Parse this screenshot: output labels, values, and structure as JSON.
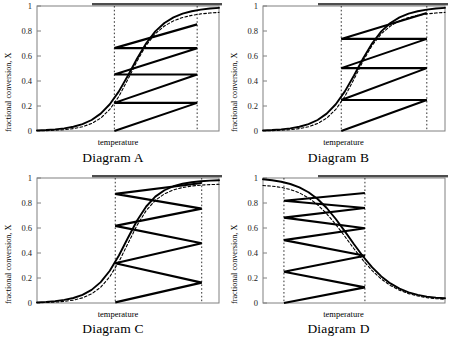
{
  "figure": {
    "panels": [
      {
        "id": "A",
        "caption": "Diagram A",
        "xlabel": "temperature",
        "ylabel": "fractional conversion, X"
      },
      {
        "id": "B",
        "caption": "Diagram B",
        "xlabel": "temperature",
        "ylabel": "fractional conversion, X"
      },
      {
        "id": "C",
        "caption": "Diagram C",
        "xlabel": "temperature",
        "ylabel": "fractional conversion, X"
      },
      {
        "id": "D",
        "caption": "Diagram D",
        "xlabel": "temperature",
        "ylabel": "fractional conversion, X"
      }
    ],
    "ytick_labels": [
      "1",
      "0.8",
      "0.6",
      "0.4",
      "0.2",
      "0"
    ],
    "colors": {
      "line": "#000000",
      "frame": "#808080",
      "dashed_guide": "#333333",
      "top_bar": "#4d4d4d"
    }
  },
  "chart_data": [
    {
      "type": "line",
      "id": "A",
      "title": "Diagram A",
      "xlabel": "temperature",
      "ylabel": "fractional conversion, X",
      "xlim": [
        0,
        1
      ],
      "ylim": [
        0,
        1
      ],
      "yticks": [
        0,
        0.2,
        0.4,
        0.6,
        0.8,
        1
      ],
      "grid": false,
      "series": [
        {
          "name": "equilibrium conversion (solid sigmoid)",
          "style": "solid",
          "x": [
            0.0,
            0.05,
            0.1,
            0.15,
            0.2,
            0.25,
            0.3,
            0.35,
            0.4,
            0.45,
            0.5,
            0.55,
            0.6,
            0.65,
            0.7,
            0.75,
            0.8,
            0.85,
            0.9,
            0.95,
            1.0
          ],
          "y": [
            0.005,
            0.008,
            0.013,
            0.021,
            0.034,
            0.055,
            0.088,
            0.139,
            0.214,
            0.317,
            0.444,
            0.58,
            0.702,
            0.797,
            0.864,
            0.909,
            0.939,
            0.958,
            0.971,
            0.98,
            0.985
          ]
        },
        {
          "name": "rate-maximum locus (dashed sigmoid)",
          "style": "dashed",
          "x": [
            0.0,
            0.05,
            0.1,
            0.15,
            0.2,
            0.25,
            0.3,
            0.35,
            0.4,
            0.45,
            0.5,
            0.55,
            0.6,
            0.65,
            0.7,
            0.75,
            0.8,
            0.85,
            0.9,
            0.95,
            1.0
          ],
          "y": [
            0.002,
            0.003,
            0.006,
            0.011,
            0.019,
            0.034,
            0.06,
            0.103,
            0.173,
            0.277,
            0.414,
            0.56,
            0.686,
            0.778,
            0.84,
            0.881,
            0.908,
            0.925,
            0.937,
            0.944,
            0.949
          ]
        }
      ],
      "operating_path": {
        "description": "Interstage-cooled staircase: adiabatic heat-up legs descending left-to-right, cooling legs horizontal back to the reactor-inlet line.",
        "points": [
          [
            0.425,
            0.0
          ],
          [
            0.88,
            0.225
          ],
          [
            0.425,
            0.225
          ],
          [
            0.88,
            0.452
          ],
          [
            0.425,
            0.452
          ],
          [
            0.88,
            0.663
          ],
          [
            0.425,
            0.663
          ],
          [
            0.88,
            0.853
          ]
        ],
        "guide_lines_x": [
          0.425,
          0.88
        ]
      }
    },
    {
      "type": "line",
      "id": "B",
      "title": "Diagram B",
      "xlabel": "temperature",
      "ylabel": "fractional conversion, X",
      "xlim": [
        0,
        1
      ],
      "ylim": [
        0,
        1
      ],
      "yticks": [
        0,
        0.2,
        0.4,
        0.6,
        0.8,
        1
      ],
      "grid": false,
      "series": [
        {
          "name": "equilibrium conversion (solid sigmoid)",
          "style": "solid",
          "x": [
            0.0,
            0.05,
            0.1,
            0.15,
            0.2,
            0.25,
            0.3,
            0.35,
            0.4,
            0.45,
            0.5,
            0.55,
            0.6,
            0.65,
            0.7,
            0.75,
            0.8,
            0.85,
            0.9,
            0.95,
            1.0
          ],
          "y": [
            0.005,
            0.008,
            0.013,
            0.021,
            0.034,
            0.055,
            0.088,
            0.139,
            0.214,
            0.317,
            0.444,
            0.58,
            0.702,
            0.797,
            0.864,
            0.909,
            0.939,
            0.958,
            0.971,
            0.98,
            0.985
          ]
        },
        {
          "name": "rate-maximum locus (dashed sigmoid)",
          "style": "dashed",
          "x": [
            0.0,
            0.05,
            0.1,
            0.15,
            0.2,
            0.25,
            0.3,
            0.35,
            0.4,
            0.45,
            0.5,
            0.55,
            0.6,
            0.65,
            0.7,
            0.75,
            0.8,
            0.85,
            0.9,
            0.95,
            1.0
          ],
          "y": [
            0.002,
            0.003,
            0.006,
            0.011,
            0.019,
            0.034,
            0.06,
            0.103,
            0.173,
            0.277,
            0.414,
            0.56,
            0.686,
            0.778,
            0.84,
            0.881,
            0.908,
            0.925,
            0.937,
            0.944,
            0.949
          ]
        }
      ],
      "operating_path": {
        "description": "Staircase with ascending adiabatic legs left-to-right and horizontal cooling legs returning leftwards.",
        "points": [
          [
            0.43,
            0.0
          ],
          [
            0.9,
            0.248
          ],
          [
            0.43,
            0.248
          ],
          [
            0.9,
            0.503
          ],
          [
            0.43,
            0.503
          ],
          [
            0.9,
            0.737
          ],
          [
            0.43,
            0.737
          ],
          [
            0.9,
            0.945
          ]
        ],
        "guide_lines_x": [
          0.43,
          0.9
        ]
      }
    },
    {
      "type": "line",
      "id": "C",
      "title": "Diagram C",
      "xlabel": "temperature",
      "ylabel": "fractional conversion, X",
      "xlim": [
        0,
        1
      ],
      "ylim": [
        0,
        1
      ],
      "yticks": [
        0,
        0.2,
        0.4,
        0.6,
        0.8,
        1
      ],
      "grid": false,
      "series": [
        {
          "name": "equilibrium conversion (solid sigmoid)",
          "style": "solid",
          "x": [
            0.0,
            0.05,
            0.1,
            0.15,
            0.2,
            0.25,
            0.3,
            0.35,
            0.4,
            0.45,
            0.5,
            0.55,
            0.6,
            0.65,
            0.7,
            0.75,
            0.8,
            0.85,
            0.9,
            0.95,
            1.0
          ],
          "y": [
            0.005,
            0.009,
            0.015,
            0.025,
            0.04,
            0.065,
            0.105,
            0.167,
            0.258,
            0.38,
            0.522,
            0.66,
            0.772,
            0.851,
            0.902,
            0.934,
            0.954,
            0.966,
            0.974,
            0.979,
            0.982
          ]
        },
        {
          "name": "rate-maximum locus (dashed sigmoid)",
          "style": "dashed",
          "x": [
            0.0,
            0.05,
            0.1,
            0.15,
            0.2,
            0.25,
            0.3,
            0.35,
            0.4,
            0.45,
            0.5,
            0.55,
            0.6,
            0.65,
            0.7,
            0.75,
            0.8,
            0.85,
            0.9,
            0.95,
            1.0
          ],
          "y": [
            0.002,
            0.004,
            0.007,
            0.013,
            0.023,
            0.041,
            0.073,
            0.126,
            0.21,
            0.33,
            0.477,
            0.622,
            0.74,
            0.821,
            0.873,
            0.905,
            0.924,
            0.936,
            0.943,
            0.947,
            0.95
          ]
        }
      ],
      "operating_path": {
        "description": "Sawtooth: ascending adiabatic legs to the right guide line, then ascending return legs back to the equilibrium curve.",
        "points": [
          [
            0.43,
            0.005
          ],
          [
            0.905,
            0.163
          ],
          [
            0.43,
            0.318
          ],
          [
            0.905,
            0.478
          ],
          [
            0.43,
            0.617
          ],
          [
            0.905,
            0.755
          ],
          [
            0.43,
            0.873
          ],
          [
            0.905,
            0.96
          ]
        ],
        "guide_lines_x": [
          0.43,
          0.905
        ]
      }
    },
    {
      "type": "line",
      "id": "D",
      "title": "Diagram D",
      "xlabel": "temperature",
      "ylabel": "fractional conversion, X",
      "xlim": [
        0,
        1
      ],
      "ylim": [
        0,
        1
      ],
      "yticks": [
        0,
        0.2,
        0.4,
        0.6,
        0.8,
        1
      ],
      "grid": false,
      "series": [
        {
          "name": "equilibrium conversion (solid decreasing sigmoid)",
          "style": "solid",
          "x": [
            0.0,
            0.05,
            0.1,
            0.15,
            0.2,
            0.25,
            0.3,
            0.35,
            0.4,
            0.45,
            0.5,
            0.55,
            0.6,
            0.65,
            0.7,
            0.75,
            0.8,
            0.85,
            0.9,
            0.95,
            1.0
          ],
          "y": [
            0.99,
            0.982,
            0.97,
            0.952,
            0.925,
            0.886,
            0.832,
            0.76,
            0.672,
            0.573,
            0.47,
            0.372,
            0.285,
            0.213,
            0.157,
            0.115,
            0.085,
            0.065,
            0.051,
            0.043,
            0.038
          ]
        },
        {
          "name": "rate-maximum locus (dashed decreasing sigmoid)",
          "style": "dashed",
          "x": [
            0.0,
            0.05,
            0.1,
            0.15,
            0.2,
            0.25,
            0.3,
            0.35,
            0.4,
            0.45,
            0.5,
            0.55,
            0.6,
            0.65,
            0.7,
            0.75,
            0.8,
            0.85,
            0.9,
            0.95,
            1.0
          ],
          "y": [
            0.94,
            0.935,
            0.925,
            0.908,
            0.881,
            0.841,
            0.786,
            0.714,
            0.628,
            0.532,
            0.434,
            0.341,
            0.259,
            0.192,
            0.14,
            0.102,
            0.075,
            0.056,
            0.043,
            0.035,
            0.03
          ]
        }
      ],
      "operating_path": {
        "description": "Sawtooth between the left guide line and the equilibrium curve for an exothermic reaction with conversion decreasing in temperature.",
        "points": [
          [
            0.115,
            0.0
          ],
          [
            0.56,
            0.125
          ],
          [
            0.115,
            0.25
          ],
          [
            0.56,
            0.378
          ],
          [
            0.115,
            0.503
          ],
          [
            0.56,
            0.598
          ],
          [
            0.115,
            0.683
          ],
          [
            0.56,
            0.76
          ],
          [
            0.115,
            0.818
          ],
          [
            0.56,
            0.88
          ]
        ],
        "guide_lines_x": [
          0.115,
          0.56
        ]
      }
    }
  ]
}
